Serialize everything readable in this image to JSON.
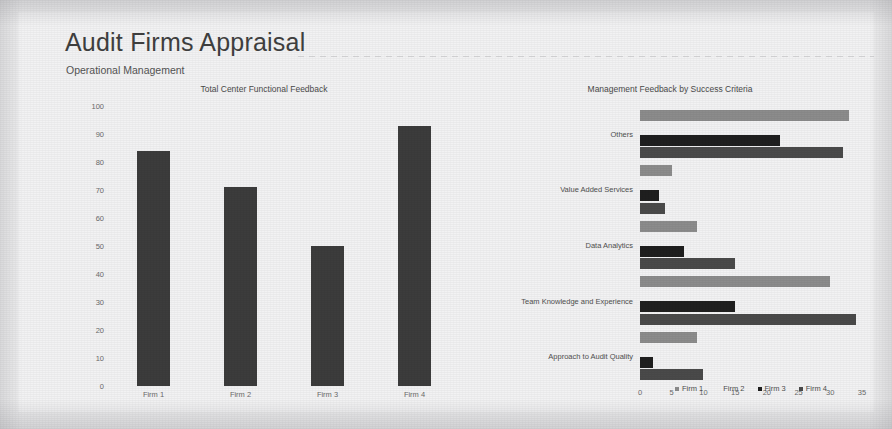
{
  "header": {
    "title": "Audit Firms Appraisal",
    "subtitle": "Operational Management"
  },
  "colors": {
    "firm1": "#8c8c8c",
    "firm2": "#f2f2f2",
    "firm3": "#1f1f1f",
    "firm4": "#4a4a4a",
    "column_bar": "#3c3c3c",
    "background": "#ececed",
    "card": "#f2f2f3",
    "text": "#3a3a3a"
  },
  "chart_data": [
    {
      "type": "bar",
      "id": "total-center-functional-feedback",
      "title": "Total Center Functional Feedback",
      "orientation": "vertical",
      "categories": [
        "Firm 1",
        "Firm 2",
        "Firm 3",
        "Firm 4"
      ],
      "values": [
        84,
        71,
        50,
        93
      ],
      "xlabel": "",
      "ylabel": "",
      "ylim": [
        0,
        100
      ],
      "yticks": [
        0,
        10,
        20,
        30,
        40,
        50,
        60,
        70,
        80,
        90,
        100
      ],
      "grid": false,
      "legend": "none"
    },
    {
      "type": "bar",
      "id": "management-feedback-by-success-criteria",
      "title": "Management Feedback by Success Criteria",
      "orientation": "horizontal",
      "categories": [
        "Approach to Audit Quality",
        "Team Knowledge and Experience",
        "Data Analytics",
        "Value Added Services",
        "Others"
      ],
      "series": [
        {
          "name": "Firm 1",
          "values": [
            9,
            30,
            9,
            5,
            33
          ]
        },
        {
          "name": "Firm 2",
          "values": [
            0,
            0,
            0,
            0,
            0
          ]
        },
        {
          "name": "Firm 3",
          "values": [
            2,
            15,
            7,
            3,
            22
          ]
        },
        {
          "name": "Firm 4",
          "values": [
            10,
            34,
            15,
            4,
            32
          ]
        }
      ],
      "xlabel": "",
      "ylabel": "",
      "xlim": [
        0,
        35
      ],
      "xticks": [
        0,
        5,
        10,
        15,
        20,
        25,
        30,
        35
      ],
      "grid": false,
      "legend": "bottom",
      "legend_entries": [
        "Firm 1",
        "Firm 2",
        "Firm 3",
        "Firm 4"
      ]
    }
  ]
}
